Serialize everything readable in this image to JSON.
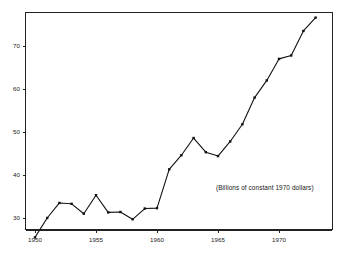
{
  "chart_data": {
    "type": "line",
    "title": "",
    "subtitle": "",
    "annotation": "(Billions of constant 1970 dollars)",
    "xlabel": "",
    "ylabel": "",
    "xlim": [
      1949.5,
      1973.5
    ],
    "ylim": [
      24.0,
      78.5
    ],
    "grid": false,
    "legend": null,
    "x_ticks": [
      1950,
      1955,
      1960,
      1965,
      1970
    ],
    "x_tick_labels": [
      "1950",
      "1955",
      "1960",
      "1965",
      "1970"
    ],
    "y_ticks": [
      30,
      40,
      50,
      60,
      70
    ],
    "y_tick_labels": [
      "30",
      "40",
      "50",
      "60",
      "70"
    ],
    "marker": "filled-square",
    "line_color": "#111111",
    "marker_color": "#111111",
    "axis_color": "#222222",
    "background_color": "#ffffff",
    "x": [
      1950,
      1951,
      1952,
      1953,
      1954,
      1955,
      1956,
      1957,
      1958,
      1959,
      1960,
      1961,
      1962,
      1963,
      1964,
      1965,
      1966,
      1967,
      1968,
      1969,
      1970,
      1971,
      1972,
      1973
    ],
    "values": [
      25.5,
      30.0,
      33.5,
      33.3,
      31.0,
      35.3,
      31.3,
      31.4,
      29.7,
      32.2,
      32.3,
      41.3,
      44.6,
      48.6,
      45.3,
      44.4,
      47.8,
      51.8,
      58.0,
      62.0,
      67.0,
      67.8,
      73.5,
      76.6
    ]
  },
  "axes": {
    "x_tick_labels": [
      "1950",
      "1955",
      "1960",
      "1965",
      "1970"
    ],
    "y_tick_labels": [
      "30",
      "40",
      "50",
      "60",
      "70"
    ]
  },
  "annotation": {
    "text": "(Billions of constant 1970 dollars)"
  }
}
